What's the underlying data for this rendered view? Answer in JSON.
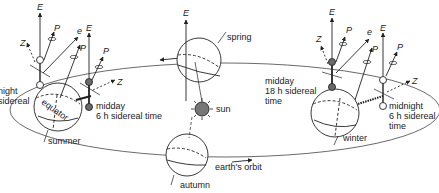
{
  "colors": {
    "ink": "#222222",
    "sun_fill": "#777777",
    "dark_ball": "#6a6a6a",
    "background": "#ffffff"
  },
  "labels": {
    "spring": "spring",
    "summer": "summer",
    "autumn": "autumn",
    "winter": "winter",
    "sun": "sun",
    "earths_orbit": "earth's orbit",
    "equator": "equator",
    "left_midnight_line1": "night",
    "left_midnight_line2": "sidereal",
    "summer_midday_line1": "midday",
    "summer_midday_line2": "6 h sidereal time",
    "winter_midday_line1": "midday",
    "winter_midday_line2": "18 h sidereal",
    "winter_midday_line3": "time",
    "winter_midnight_line1": "midnight",
    "winter_midnight_line2": "6 h sidereal",
    "winter_midnight_line3": "time"
  },
  "axes": {
    "E": "E",
    "P": "P",
    "Z": "Z",
    "e": "e"
  },
  "icons": {
    "orbit_direction_top": "arrow-left-icon",
    "orbit_direction_bottom": "arrow-right-icon",
    "sun": "sun-icon"
  }
}
